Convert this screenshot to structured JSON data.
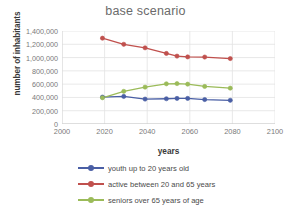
{
  "chart_data": {
    "type": "line",
    "title": "base scenario",
    "xlabel": "years",
    "ylabel": "number of inhabitants",
    "xlim": [
      2000,
      2100
    ],
    "ylim": [
      0,
      1400000
    ],
    "grid": true,
    "legend_position": "bottom",
    "x_ticks": [
      2000,
      2020,
      2040,
      2060,
      2080,
      2100
    ],
    "x_tick_labels": [
      "2000",
      "2020",
      "2040",
      "2060",
      "2080",
      "2100"
    ],
    "y_ticks": [
      0,
      200000,
      400000,
      600000,
      800000,
      1000000,
      1200000,
      1400000
    ],
    "y_tick_labels": [
      "0",
      "200,000",
      "400,000",
      "600,000",
      "800,000",
      "1,000,000",
      "1,200,000",
      "1,400,000"
    ],
    "x": [
      2019,
      2029,
      2039,
      2049,
      2054,
      2059,
      2067,
      2079
    ],
    "series": [
      {
        "name": "youth up to 20 years old",
        "color": "#4a5fa5",
        "values": [
          405000,
          415000,
          375000,
          380000,
          385000,
          385000,
          368000,
          357000
        ]
      },
      {
        "name": "active between 20 and 65 years",
        "color": "#c0504d",
        "values": [
          1292000,
          1200000,
          1147000,
          1062000,
          1022000,
          1010000,
          1008000,
          985000
        ]
      },
      {
        "name": "seniors over 65 years of age",
        "color": "#9bbb59",
        "values": [
          395000,
          492000,
          555000,
          605000,
          608000,
          600000,
          565000,
          540000
        ]
      }
    ]
  }
}
